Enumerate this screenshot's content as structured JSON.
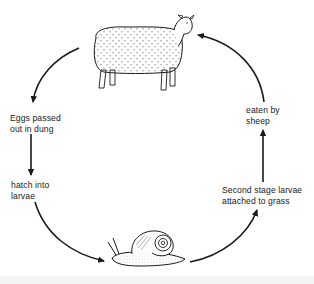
{
  "diagram": {
    "type": "life-cycle",
    "organisms": {
      "host": "sheep",
      "intermediate_host": "snail"
    },
    "stages": [
      {
        "id": "eggs",
        "lines": [
          "Eggs passed",
          "out in dung"
        ]
      },
      {
        "id": "hatch",
        "lines": [
          "hatch into",
          "larvae"
        ]
      },
      {
        "id": "second-stage",
        "lines": [
          "Second stage larvae",
          "attached to grass"
        ]
      },
      {
        "id": "eaten",
        "lines": [
          "eaten by",
          "sheep"
        ]
      }
    ],
    "flow": [
      "sheep",
      "eggs",
      "hatch",
      "snail",
      "second-stage",
      "eaten",
      "sheep"
    ],
    "colors": {
      "ink": "#1a1a1a",
      "background": "#ffffff"
    }
  }
}
